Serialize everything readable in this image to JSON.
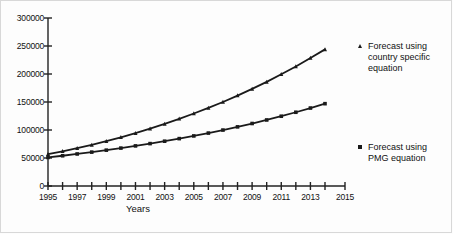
{
  "chart_data": {
    "type": "line",
    "title": "",
    "xlabel": "Years",
    "ylabel": "",
    "xlim": [
      1995,
      2015
    ],
    "ylim": [
      0,
      300000
    ],
    "grid": false,
    "legend_position": "right",
    "y_ticks": [
      0,
      50000,
      100000,
      150000,
      200000,
      250000,
      300000
    ],
    "y_tick_labels": [
      "0",
      "50000",
      "100000",
      "150000",
      "200000",
      "250000",
      "300000"
    ],
    "x_ticks": [
      1995,
      1996,
      1997,
      1998,
      1999,
      2000,
      2001,
      2002,
      2003,
      2004,
      2005,
      2006,
      2007,
      2008,
      2009,
      2010,
      2011,
      2012,
      2013,
      2014,
      2015
    ],
    "x_tick_labels": [
      "1995",
      "1997",
      "1999",
      "2001",
      "2003",
      "2005",
      "2007",
      "2009",
      "2011",
      "2013",
      "2015"
    ],
    "x": [
      1995,
      1996,
      1997,
      1998,
      1999,
      2000,
      2001,
      2002,
      2003,
      2004,
      2005,
      2006,
      2007,
      2008,
      2009,
      2010,
      2011,
      2012,
      2013,
      2014
    ],
    "series": [
      {
        "name": "Forecast using country specific equation",
        "marker": "triangle",
        "color": "#1a1a1a",
        "values": [
          57000,
          62000,
          67500,
          73500,
          80000,
          87000,
          94500,
          102500,
          111000,
          120000,
          129500,
          139500,
          150000,
          161500,
          173500,
          186000,
          199500,
          213500,
          228500,
          244000
        ]
      },
      {
        "name": "Forecast using PMG equation",
        "marker": "square",
        "color": "#1a1a1a",
        "values": [
          51000,
          54000,
          57200,
          60500,
          64000,
          67700,
          71600,
          75700,
          80000,
          84600,
          89400,
          94500,
          99900,
          105600,
          111600,
          117900,
          124600,
          131700,
          139200,
          147000
        ]
      }
    ]
  },
  "legend": {
    "entries": [
      {
        "marker": "triangle-marker-icon",
        "label": "Forecast using\ncountry specific\nequation"
      },
      {
        "marker": "square-marker-icon",
        "label": "Forecast using\nPMG equation"
      }
    ]
  },
  "axes": {
    "x_title": "Years"
  }
}
